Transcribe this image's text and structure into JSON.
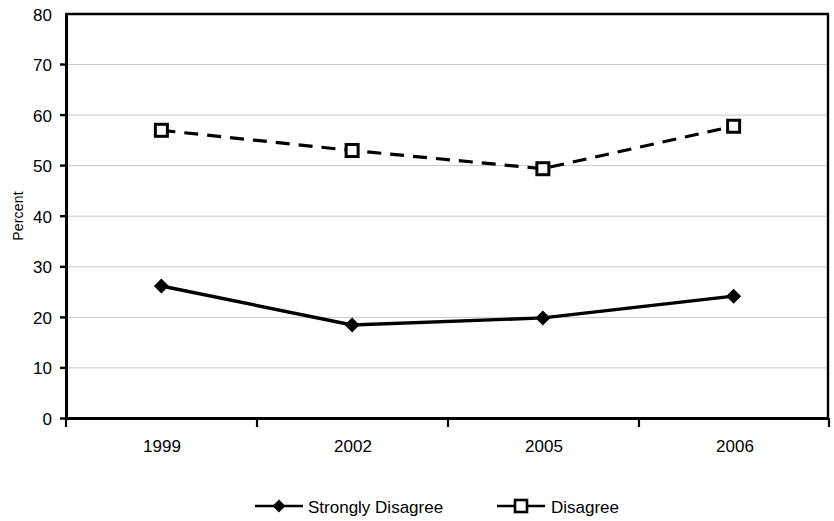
{
  "chart_data": {
    "type": "line",
    "title": "",
    "subtitle": "",
    "xlabel": "",
    "ylabel": "Percent",
    "categories": [
      "1999",
      "2002",
      "2005",
      "2006"
    ],
    "series": [
      {
        "name": "Strongly Disagree",
        "values": [
          26.2,
          18.5,
          19.9,
          24.2
        ],
        "marker": "filled-diamond",
        "line_style": "solid",
        "color": "#000000"
      },
      {
        "name": "Disagree",
        "values": [
          57.0,
          53.0,
          49.4,
          57.8
        ],
        "marker": "open-square",
        "line_style": "dashed",
        "color": "#000000"
      }
    ],
    "ylim": [
      0,
      80
    ],
    "ytick_step": 10,
    "yticks": [
      "0",
      "10",
      "20",
      "30",
      "40",
      "50",
      "60",
      "70",
      "80"
    ],
    "grid": "horizontal",
    "legend_position": "bottom",
    "plot_border": true
  },
  "legend": {
    "entries": [
      {
        "label": "Strongly Disagree",
        "marker": "filled-diamond"
      },
      {
        "label": "Disagree",
        "marker": "open-square"
      }
    ]
  },
  "colors": {
    "ink": "#000000",
    "gridline": "#c9c9c9",
    "background": "#ffffff"
  }
}
